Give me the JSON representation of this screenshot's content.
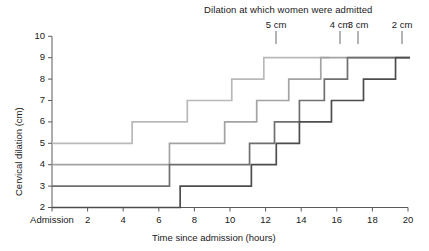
{
  "chart_data": {
    "type": "line",
    "subtype": "step-post",
    "title": "Dilation at which women were admitted",
    "xlabel": "Time since admission (hours)",
    "ylabel": "Cervical dilation (cm)",
    "xlim": [
      0,
      20
    ],
    "ylim": [
      2,
      10
    ],
    "grid": false,
    "legend_position": "top-inline-leader-lines",
    "x_tick_values": [
      0,
      2,
      4,
      6,
      8,
      10,
      12,
      14,
      16,
      18,
      20
    ],
    "x_tick_labels": [
      "Admission",
      "2",
      "4",
      "6",
      "8",
      "10",
      "12",
      "14",
      "16",
      "18",
      "20"
    ],
    "y_tick_values": [
      2,
      3,
      4,
      5,
      6,
      7,
      8,
      9,
      10
    ],
    "y_tick_labels": [
      "2",
      "3",
      "4",
      "5",
      "6",
      "7",
      "8",
      "9",
      "10"
    ],
    "series": [
      {
        "name": "5 cm",
        "label": "5 cm",
        "color": "#b9b9b9",
        "leader_x": 15.6,
        "admission_dilation": 5,
        "points": [
          {
            "x": 0.0,
            "y": 5
          },
          {
            "x": 4.5,
            "y": 6
          },
          {
            "x": 7.6,
            "y": 7
          },
          {
            "x": 10.1,
            "y": 8
          },
          {
            "x": 11.9,
            "y": 9
          },
          {
            "x": 15.6,
            "y": 9
          }
        ]
      },
      {
        "name": "4 cm",
        "label": "4 cm",
        "color": "#a3a3a3",
        "leader_x": 19.2,
        "admission_dilation": 4,
        "points": [
          {
            "x": 0.0,
            "y": 4
          },
          {
            "x": 6.6,
            "y": 5
          },
          {
            "x": 9.7,
            "y": 6
          },
          {
            "x": 11.5,
            "y": 7
          },
          {
            "x": 13.3,
            "y": 8
          },
          {
            "x": 15.1,
            "y": 9
          },
          {
            "x": 19.2,
            "y": 9
          }
        ]
      },
      {
        "name": "3 cm",
        "label": "3 cm",
        "color": "#6f6f6f",
        "leader_x": 20.2,
        "admission_dilation": 3,
        "points": [
          {
            "x": 0.0,
            "y": 3
          },
          {
            "x": 6.6,
            "y": 4
          },
          {
            "x": 11.1,
            "y": 5
          },
          {
            "x": 12.5,
            "y": 6
          },
          {
            "x": 13.9,
            "y": 7
          },
          {
            "x": 15.3,
            "y": 8
          },
          {
            "x": 16.6,
            "y": 9
          },
          {
            "x": 20.2,
            "y": 9
          }
        ]
      },
      {
        "name": "2 cm",
        "label": "2 cm",
        "color": "#4d4d4d",
        "leader_x": 22.7,
        "admission_dilation": 2,
        "points": [
          {
            "x": 0.0,
            "y": 2
          },
          {
            "x": 7.2,
            "y": 3
          },
          {
            "x": 11.2,
            "y": 4
          },
          {
            "x": 12.6,
            "y": 5
          },
          {
            "x": 13.9,
            "y": 6
          },
          {
            "x": 15.7,
            "y": 7
          },
          {
            "x": 17.5,
            "y": 8
          },
          {
            "x": 19.3,
            "y": 9
          },
          {
            "x": 22.7,
            "y": 9
          }
        ]
      }
    ]
  },
  "colors": {
    "axis": "#5a5a5a",
    "text": "#1a1a1a",
    "background": "#ffffff"
  }
}
